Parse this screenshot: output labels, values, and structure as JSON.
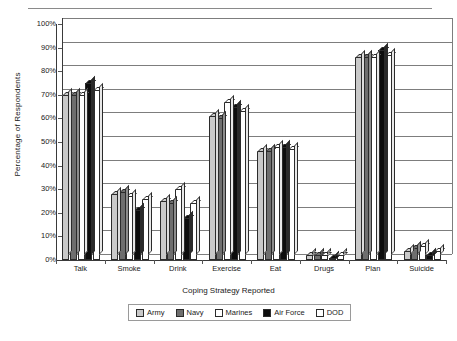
{
  "chart_data": {
    "type": "bar",
    "title": "",
    "xlabel": "Coping Strategy Reported",
    "ylabel": "Percentage of Respondents",
    "ylim": [
      0,
      100
    ],
    "ytick_labels": [
      "0%",
      "10%",
      "20%",
      "30%",
      "40%",
      "50%",
      "60%",
      "70%",
      "80%",
      "90%",
      "100%"
    ],
    "ytick_values": [
      0,
      10,
      20,
      30,
      40,
      50,
      60,
      70,
      80,
      90,
      100
    ],
    "grid": true,
    "legend_position": "bottom",
    "categories": [
      "Talk",
      "Smoke",
      "Drink",
      "Exercise",
      "Eat",
      "Drugs",
      "Plan",
      "Suicide"
    ],
    "series": [
      {
        "name": "Army",
        "color": "#c9c9c9",
        "values": [
          70,
          28,
          25,
          61,
          46,
          2,
          86,
          4
        ]
      },
      {
        "name": "Navy",
        "color": "#6e6e6e",
        "values": [
          70,
          29,
          24,
          60,
          46,
          2,
          86,
          5
        ]
      },
      {
        "name": "Marines",
        "color": "#ffffff",
        "values": [
          70,
          27,
          30,
          67,
          48,
          2,
          86,
          6
        ]
      },
      {
        "name": "Air Force",
        "color": "#0d0d0d",
        "values": [
          75,
          21,
          18,
          65,
          48,
          1,
          89,
          2
        ]
      },
      {
        "name": "DOD",
        "color": "#ffffff",
        "values": [
          72,
          26,
          24,
          63,
          47,
          2,
          87,
          4
        ]
      }
    ]
  },
  "legend": {
    "items": [
      {
        "label": "Army"
      },
      {
        "label": "Navy"
      },
      {
        "label": "Marines"
      },
      {
        "label": "Air Force"
      },
      {
        "label": "DOD"
      }
    ]
  }
}
